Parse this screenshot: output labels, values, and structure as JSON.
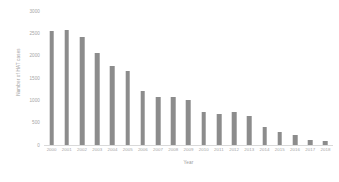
{
  "chart_data": {
    "type": "bar",
    "title": "",
    "xlabel": "Year",
    "ylabel": "Number of HAT cases",
    "categories": [
      "2000",
      "2001",
      "2002",
      "2003",
      "2004",
      "2005",
      "2006",
      "2007",
      "2008",
      "2009",
      "2010",
      "2011",
      "2012",
      "2013",
      "2014",
      "2015",
      "2016",
      "2017",
      "2018"
    ],
    "values": [
      2550,
      2570,
      2410,
      2060,
      1780,
      1660,
      1200,
      1080,
      1080,
      1000,
      730,
      690,
      740,
      640,
      400,
      290,
      220,
      120,
      90
    ],
    "ylim": [
      0,
      3000
    ],
    "yticks": [
      0,
      500,
      1000,
      1500,
      2000,
      2500,
      3000
    ],
    "ytick_labels": [
      "0",
      "500",
      "1000",
      "1500",
      "2000",
      "2500",
      "3000"
    ],
    "grid": false,
    "legend": false,
    "legend_position": "none",
    "bar_color": "#8c8c8c",
    "axis_text_color": "#a5a5a5",
    "axis_line_color": "#d9d9d9",
    "background_color": "#ffffff"
  }
}
